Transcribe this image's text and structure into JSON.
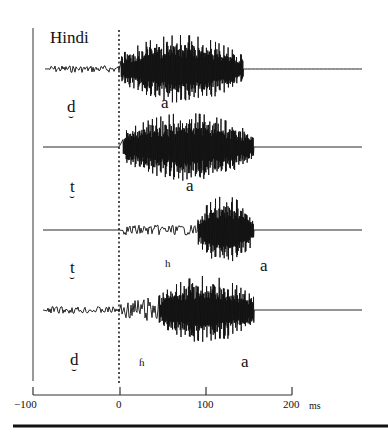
{
  "figure": {
    "title": "Hindi",
    "rows": [
      {
        "consonant": "d",
        "diacritic": "dental",
        "aspiration": "",
        "vowel": "a",
        "voice_onset_ms": 0,
        "prevoicing": true,
        "burst_ms": 0,
        "vowel_start_ms": 0,
        "vowel_end_ms": 140
      },
      {
        "consonant": "t",
        "diacritic": "dental",
        "aspiration": "",
        "vowel": "a",
        "voice_onset_ms": 15,
        "prevoicing": false,
        "burst_ms": 0,
        "vowel_start_ms": 10,
        "vowel_end_ms": 150
      },
      {
        "consonant": "t",
        "diacritic": "dental",
        "aspiration": "h",
        "vowel": "a",
        "voice_onset_ms": 90,
        "prevoicing": false,
        "burst_ms": 0,
        "vowel_start_ms": 90,
        "vowel_end_ms": 150
      },
      {
        "consonant": "d",
        "diacritic": "dental",
        "aspiration": "ɦ",
        "vowel": "a",
        "voice_onset_ms": 0,
        "prevoicing": true,
        "burst_ms": 0,
        "vowel_start_ms": 50,
        "vowel_end_ms": 140
      }
    ],
    "axis": {
      "ticks": [
        "−100",
        "0",
        "100",
        "200"
      ],
      "unit": "ms"
    },
    "diacritic_glyph": "̪"
  },
  "chart_data": {
    "type": "line",
    "title": "Hindi",
    "xlabel": "ms",
    "ylabel": "",
    "xlim": [
      -100,
      200
    ],
    "x_ticks": [
      -100,
      0,
      100,
      200
    ],
    "grid": false,
    "reference_line": {
      "x": 0,
      "style": "dotted",
      "meaning": "stop release"
    },
    "series": [
      {
        "name": "d̪a",
        "segments": [
          {
            "label": "d̪",
            "from": -85,
            "to": 0,
            "type": "prevoicing"
          },
          {
            "label": "a",
            "from": 0,
            "to": 143,
            "type": "vowel"
          }
        ]
      },
      {
        "name": "t̪a",
        "segments": [
          {
            "label": "t̪",
            "from": -90,
            "to": 0,
            "type": "closure-silence"
          },
          {
            "label": "a",
            "from": 2,
            "to": 155,
            "type": "vowel"
          }
        ]
      },
      {
        "name": "t̪ʰa",
        "segments": [
          {
            "label": "t̪",
            "from": -90,
            "to": 0,
            "type": "closure-silence"
          },
          {
            "label": "h",
            "from": 0,
            "to": 90,
            "type": "aspiration"
          },
          {
            "label": "a",
            "from": 90,
            "to": 155,
            "type": "vowel"
          }
        ]
      },
      {
        "name": "d̪ɦa",
        "segments": [
          {
            "label": "d̪",
            "from": -85,
            "to": 0,
            "type": "prevoicing"
          },
          {
            "label": "ɦ",
            "from": 0,
            "to": 45,
            "type": "breathy"
          },
          {
            "label": "a",
            "from": 45,
            "to": 155,
            "type": "vowel"
          }
        ]
      }
    ]
  }
}
